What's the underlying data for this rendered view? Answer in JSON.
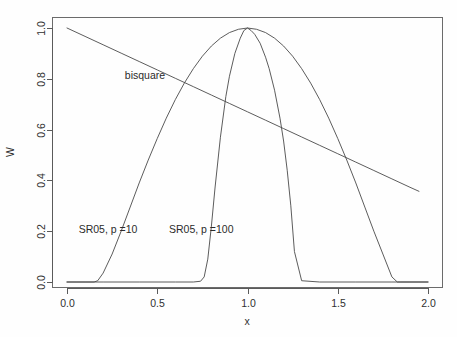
{
  "chart_data": {
    "type": "line",
    "title": "",
    "subtitle": "",
    "xlabel": "x",
    "ylabel": "W",
    "xlim": [
      0.0,
      2.0
    ],
    "ylim": [
      0.0,
      1.0
    ],
    "grid": false,
    "legend_position": "inline-annotations",
    "xticks": [
      "0.0",
      "0.5",
      "1.0",
      "1.5",
      "2.0"
    ],
    "xtick_values": [
      0.0,
      0.5,
      1.0,
      1.5,
      2.0
    ],
    "yticks": [
      "0.0",
      "0.2",
      "0.4",
      "0.6",
      "0.8",
      "1.0"
    ],
    "ytick_values": [
      0.0,
      0.2,
      0.4,
      0.6,
      0.8,
      1.0
    ],
    "annotations": [
      {
        "label": "bisquare",
        "x": 0.32,
        "y": 0.8
      },
      {
        "label": "SR05, p =10",
        "x": 0.065,
        "y": 0.195
      },
      {
        "label": "SR05, p =100",
        "x": 0.565,
        "y": 0.195
      }
    ],
    "series": [
      {
        "name": "bisquare",
        "x": [
          0.0,
          0.1,
          0.2,
          0.3,
          0.4,
          0.5,
          0.6,
          0.7,
          0.8,
          0.9,
          1.0,
          1.1,
          1.2,
          1.3,
          1.4,
          1.5,
          1.6,
          1.7,
          1.8,
          1.9,
          1.95
        ],
        "values": [
          1.0,
          0.967,
          0.934,
          0.901,
          0.868,
          0.835,
          0.802,
          0.769,
          0.736,
          0.703,
          0.67,
          0.637,
          0.604,
          0.571,
          0.538,
          0.505,
          0.472,
          0.439,
          0.406,
          0.373,
          0.357
        ]
      },
      {
        "name": "SR05, p =10",
        "x": [
          0.0,
          0.05,
          0.1,
          0.15,
          0.17,
          0.2,
          0.25,
          0.3,
          0.35,
          0.4,
          0.45,
          0.5,
          0.55,
          0.6,
          0.65,
          0.7,
          0.75,
          0.8,
          0.85,
          0.9,
          0.95,
          1.0,
          1.05,
          1.1,
          1.15,
          1.2,
          1.25,
          1.3,
          1.35,
          1.4,
          1.45,
          1.5,
          1.55,
          1.6,
          1.65,
          1.7,
          1.75,
          1.8,
          1.83,
          1.85,
          1.9,
          1.95,
          2.0
        ],
        "values": [
          0.0,
          0.0,
          0.0,
          0.0,
          0.005,
          0.035,
          0.11,
          0.2,
          0.295,
          0.39,
          0.48,
          0.565,
          0.645,
          0.718,
          0.783,
          0.84,
          0.889,
          0.929,
          0.96,
          0.982,
          0.995,
          1.0,
          0.995,
          0.982,
          0.96,
          0.929,
          0.889,
          0.84,
          0.783,
          0.718,
          0.645,
          0.565,
          0.48,
          0.39,
          0.295,
          0.2,
          0.11,
          0.02,
          0.0,
          0.0,
          0.0,
          0.0,
          0.0
        ]
      },
      {
        "name": "SR05, p =100",
        "x": [
          0.0,
          0.2,
          0.4,
          0.6,
          0.7,
          0.74,
          0.76,
          0.78,
          0.8,
          0.82,
          0.85,
          0.88,
          0.9,
          0.93,
          0.96,
          0.98,
          1.0,
          1.02,
          1.04,
          1.07,
          1.1,
          1.12,
          1.15,
          1.18,
          1.2,
          1.22,
          1.24,
          1.26,
          1.3,
          1.4,
          1.6,
          1.8,
          2.0
        ],
        "values": [
          0.0,
          0.0,
          0.0,
          0.0,
          0.0,
          0.003,
          0.02,
          0.09,
          0.22,
          0.37,
          0.57,
          0.73,
          0.81,
          0.9,
          0.96,
          0.99,
          1.0,
          0.99,
          0.975,
          0.94,
          0.885,
          0.84,
          0.755,
          0.645,
          0.555,
          0.44,
          0.3,
          0.12,
          0.005,
          0.0,
          0.0,
          0.0,
          0.0
        ]
      }
    ]
  },
  "colors": {
    "background": "#fefefe",
    "axis": "#5a5a5a",
    "curve": "#4a4a4a",
    "text": "#2b2b2b"
  }
}
